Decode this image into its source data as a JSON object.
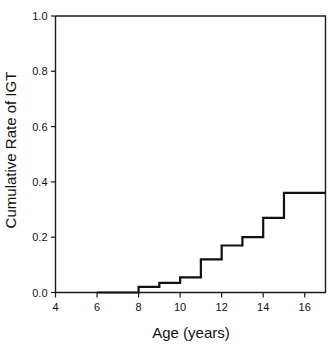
{
  "chart_data": {
    "type": "line",
    "subtype": "step",
    "title": "",
    "xlabel": "Age (years)",
    "ylabel": "Cumulative Rate of IGT",
    "xlim": [
      4,
      17
    ],
    "ylim": [
      0.0,
      1.0
    ],
    "xticks": [
      4,
      6,
      8,
      10,
      12,
      14,
      16
    ],
    "xtick_labels": [
      "4",
      "6",
      "8",
      "10",
      "12",
      "14",
      "16"
    ],
    "yticks": [
      0.0,
      0.2,
      0.4,
      0.6,
      0.8,
      1.0
    ],
    "ytick_labels": [
      "0.0",
      "0.2",
      "0.4",
      "0.6",
      "0.8",
      "1.0"
    ],
    "grid": false,
    "legend": null,
    "series": [
      {
        "name": "Cumulative Rate of IGT",
        "color": "#111111",
        "x": [
          6,
          8,
          9,
          10,
          11,
          12,
          13,
          14,
          15,
          17
        ],
        "values": [
          0.0,
          0.02,
          0.035,
          0.055,
          0.12,
          0.17,
          0.2,
          0.27,
          0.36,
          0.36
        ]
      }
    ],
    "steps": [
      {
        "x_start": 6,
        "x_end": 8,
        "y": 0.0
      },
      {
        "x_start": 8,
        "x_end": 9,
        "y": 0.02
      },
      {
        "x_start": 9,
        "x_end": 10,
        "y": 0.035
      },
      {
        "x_start": 10,
        "x_end": 11,
        "y": 0.055
      },
      {
        "x_start": 11,
        "x_end": 12,
        "y": 0.12
      },
      {
        "x_start": 12,
        "x_end": 13,
        "y": 0.17
      },
      {
        "x_start": 13,
        "x_end": 14,
        "y": 0.2
      },
      {
        "x_start": 14,
        "x_end": 15,
        "y": 0.27
      },
      {
        "x_start": 15,
        "x_end": 17,
        "y": 0.36
      }
    ]
  },
  "axes": {
    "x_title": "Age (years)",
    "y_title": "Cumulative Rate of IGT"
  },
  "colors": {
    "curve": "#111111",
    "axis": "#1a1a1a",
    "background": "#ffffff"
  }
}
